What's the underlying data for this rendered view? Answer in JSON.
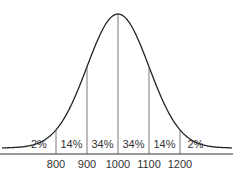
{
  "chart_data": {
    "type": "area",
    "title": "",
    "xlabel": "",
    "ylabel": "",
    "distribution": "normal",
    "mean": 1000,
    "std_dev": 100,
    "x_ticks": [
      "800",
      "900",
      "1000",
      "1100",
      "1200"
    ],
    "segments": [
      {
        "range": "<800",
        "label": "2%",
        "value": 2
      },
      {
        "range": "800-900",
        "label": "14%",
        "value": 14
      },
      {
        "range": "900-1000",
        "label": "34%",
        "value": 34
      },
      {
        "range": "1000-1100",
        "label": "34%",
        "value": 34
      },
      {
        "range": "1100-1200",
        "label": "14%",
        "value": 14
      },
      {
        "range": ">1200",
        "label": "2%",
        "value": 2
      }
    ],
    "grid": false,
    "legend": "none"
  },
  "colors": {
    "line": "#222222",
    "divider": "#555555",
    "text": "#333333",
    "background": "#ffffff"
  }
}
